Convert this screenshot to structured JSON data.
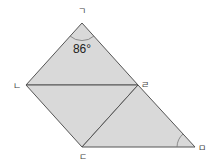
{
  "diagram": {
    "vertices": {
      "giyeok": {
        "label": "ㄱ",
        "x": 82,
        "y": 23
      },
      "nieun": {
        "label": "ㄴ",
        "x": 26,
        "y": 85
      },
      "rieul": {
        "label": "ㄹ",
        "x": 138,
        "y": 85
      },
      "digeut": {
        "label": "ㄷ",
        "x": 82,
        "y": 147
      },
      "mieum": {
        "label": "ㅁ",
        "x": 195,
        "y": 147
      }
    },
    "angle_label": "86°",
    "colors": {
      "fill": "#d9d9d9",
      "stroke": "#555555"
    }
  }
}
